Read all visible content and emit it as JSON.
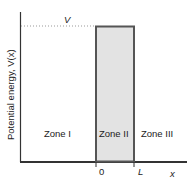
{
  "diagram": {
    "y_axis_label": "Potential energy, V(x)",
    "x_axis_label": "x",
    "barrier_height_label": "V",
    "tick_zero": "0",
    "tick_L": "L",
    "zones": [
      "Zone I",
      "Zone II",
      "Zone III"
    ],
    "colors": {
      "axis": "#333333",
      "barrier_fill": "#e3e3e3",
      "barrier_stroke": "#555555",
      "dotted": "#999999"
    }
  }
}
